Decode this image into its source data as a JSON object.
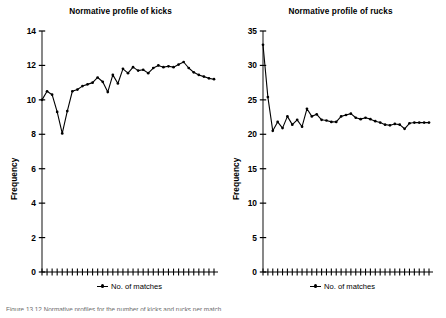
{
  "figure": {
    "caption": "Figure 13.12 Normative profiles for the number of kicks and rucks per match"
  },
  "panels": [
    {
      "id": "kicks",
      "title": "Normative profile of kicks",
      "ylabel": "Frequency",
      "legend_label": "No. of matches"
    },
    {
      "id": "rucks",
      "title": "Normative profile of rucks",
      "ylabel": "Frequency",
      "legend_label": "No. of matches"
    }
  ],
  "chart_data": [
    {
      "type": "line",
      "title": "Normative profile of kicks",
      "xlabel": "",
      "ylabel": "Frequency",
      "ylim": [
        0,
        14
      ],
      "yticks": [
        0,
        2,
        4,
        6,
        8,
        10,
        12,
        14
      ],
      "xlim": [
        1,
        35
      ],
      "xticks_labeled": false,
      "n_xticks": 35,
      "grid": false,
      "legend_position": "below",
      "series": [
        {
          "name": "No. of matches",
          "marker": "filled-circle",
          "color": "#000000",
          "x": [
            1,
            2,
            3,
            4,
            5,
            6,
            7,
            8,
            9,
            10,
            11,
            12,
            13,
            14,
            15,
            16,
            17,
            18,
            19,
            20,
            21,
            22,
            23,
            24,
            25,
            26,
            27,
            28,
            29,
            30,
            31,
            32,
            33,
            34,
            35
          ],
          "values": [
            10.0,
            10.5,
            10.3,
            9.3,
            8.05,
            9.35,
            10.5,
            10.6,
            10.8,
            10.9,
            11.0,
            11.3,
            11.05,
            10.45,
            11.45,
            10.95,
            11.8,
            11.55,
            11.9,
            11.7,
            11.75,
            11.55,
            11.85,
            12.0,
            11.9,
            11.95,
            11.9,
            12.05,
            12.2,
            11.85,
            11.6,
            11.45,
            11.35,
            11.25,
            11.2
          ]
        }
      ]
    },
    {
      "type": "line",
      "title": "Normative profile of rucks",
      "xlabel": "",
      "ylabel": "Frequency",
      "ylim": [
        0,
        35
      ],
      "yticks": [
        0,
        5,
        10,
        15,
        20,
        25,
        30,
        35
      ],
      "xlim": [
        1,
        35
      ],
      "xticks_labeled": false,
      "n_xticks": 35,
      "grid": false,
      "legend_position": "below",
      "series": [
        {
          "name": "No. of matches",
          "marker": "filled-circle",
          "color": "#000000",
          "x": [
            1,
            2,
            3,
            4,
            5,
            6,
            7,
            8,
            9,
            10,
            11,
            12,
            13,
            14,
            15,
            16,
            17,
            18,
            19,
            20,
            21,
            22,
            23,
            24,
            25,
            26,
            27,
            28,
            29,
            30,
            31,
            32,
            33,
            34,
            35
          ],
          "values": [
            33.0,
            25.4,
            20.5,
            21.8,
            20.9,
            22.6,
            21.4,
            22.1,
            21.1,
            23.7,
            22.6,
            22.9,
            22.1,
            22.0,
            21.8,
            21.8,
            22.6,
            22.8,
            23.0,
            22.4,
            22.2,
            22.4,
            22.2,
            21.9,
            21.7,
            21.4,
            21.3,
            21.5,
            21.4,
            20.8,
            21.6,
            21.7,
            21.7,
            21.7,
            21.7
          ]
        }
      ]
    }
  ]
}
